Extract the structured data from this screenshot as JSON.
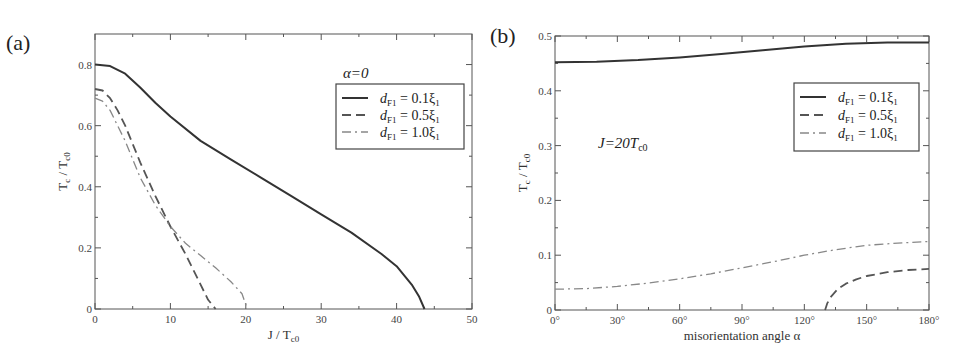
{
  "chart_data": [
    {
      "panel": "(a)",
      "type": "line",
      "title": "",
      "annotation": "α=0",
      "xlabel": "J / T",
      "xlabel_sub": "c0",
      "ylabel": "T",
      "ylabel_sub": "c",
      "ylabel_tail": " / T",
      "ylabel_sub2": "c0",
      "xlim": [
        0,
        50
      ],
      "ylim": [
        0,
        0.9
      ],
      "xticks": [
        0,
        10,
        20,
        30,
        40,
        50
      ],
      "xtick_labels": [
        "0",
        "10",
        "20",
        "30",
        "40",
        "50"
      ],
      "yticks": [
        0,
        0.2,
        0.4,
        0.6,
        0.8
      ],
      "ytick_labels": [
        "0",
        "0.2",
        "0.4",
        "0.6",
        "0.8"
      ],
      "grid": false,
      "legend_position": "upper right",
      "series": [
        {
          "name": "d_F1 = 0.1ξ1",
          "legend_text": "= 0.1ξ",
          "style": "solid",
          "x": [
            0,
            2,
            4,
            6,
            8,
            10,
            14,
            18,
            22,
            26,
            30,
            34,
            38,
            40,
            42,
            43,
            43.7
          ],
          "y": [
            0.8,
            0.795,
            0.77,
            0.725,
            0.675,
            0.63,
            0.55,
            0.49,
            0.43,
            0.37,
            0.31,
            0.25,
            0.18,
            0.14,
            0.08,
            0.04,
            0.0
          ]
        },
        {
          "name": "d_F1 = 0.5ξ1",
          "legend_text": "= 0.5ξ",
          "style": "dashed",
          "x": [
            0,
            1,
            2,
            3,
            4,
            5,
            6,
            8,
            10,
            12,
            14,
            15,
            16
          ],
          "y": [
            0.72,
            0.715,
            0.69,
            0.65,
            0.6,
            0.54,
            0.48,
            0.37,
            0.27,
            0.18,
            0.08,
            0.03,
            0.0
          ]
        },
        {
          "name": "d_F1 = 1.0ξ1",
          "legend_text": "= 1.0ξ",
          "style": "dashdot",
          "x": [
            0,
            1,
            2,
            3,
            4,
            5,
            6,
            8,
            10,
            12,
            14,
            16,
            18,
            19.5,
            20.2
          ],
          "y": [
            0.69,
            0.68,
            0.65,
            0.6,
            0.55,
            0.49,
            0.43,
            0.34,
            0.27,
            0.215,
            0.175,
            0.135,
            0.09,
            0.05,
            0.0
          ]
        }
      ]
    },
    {
      "panel": "(b)",
      "type": "line",
      "title": "",
      "annotation": "J=20T",
      "annotation_sub": "c0",
      "xlabel": "misorientation angle α",
      "ylabel": "T",
      "ylabel_sub": "c",
      "ylabel_tail": " / T",
      "ylabel_sub2": "c0",
      "xlim": [
        0,
        180
      ],
      "ylim": [
        0,
        0.5
      ],
      "xticks": [
        0,
        30,
        60,
        90,
        120,
        150,
        180
      ],
      "xtick_labels": [
        "0°",
        "30°",
        "60°",
        "90°",
        "120°",
        "150°",
        "180°"
      ],
      "yticks": [
        0,
        0.1,
        0.2,
        0.3,
        0.4,
        0.5
      ],
      "ytick_labels": [
        "0",
        "0.1",
        "0.2",
        "0.3",
        "0.4",
        "0.5"
      ],
      "grid": false,
      "legend_position": "upper right",
      "series": [
        {
          "name": "d_F1 = 0.1ξ1",
          "legend_text": "= 0.1ξ",
          "style": "solid",
          "x": [
            0,
            20,
            40,
            60,
            80,
            100,
            120,
            140,
            160,
            180
          ],
          "y": [
            0.452,
            0.453,
            0.456,
            0.461,
            0.467,
            0.474,
            0.481,
            0.486,
            0.488,
            0.488
          ]
        },
        {
          "name": "d_F1 = 0.5ξ1",
          "legend_text": "= 0.5ξ",
          "style": "dashed",
          "x": [
            130,
            131,
            133,
            136,
            140,
            145,
            150,
            160,
            170,
            180
          ],
          "y": [
            0.0,
            0.012,
            0.025,
            0.038,
            0.048,
            0.056,
            0.062,
            0.069,
            0.073,
            0.075
          ]
        },
        {
          "name": "d_F1 = 1.0ξ1",
          "legend_text": "= 1.0ξ",
          "style": "dashdot",
          "x": [
            0,
            15,
            30,
            45,
            60,
            75,
            90,
            105,
            120,
            135,
            150,
            165,
            180
          ],
          "y": [
            0.038,
            0.039,
            0.043,
            0.049,
            0.057,
            0.066,
            0.077,
            0.088,
            0.1,
            0.11,
            0.118,
            0.122,
            0.125
          ]
        }
      ]
    }
  ],
  "layout": {
    "panels": [
      {
        "x0": 95,
        "x1": 472,
        "y0": 309,
        "y1": 34
      },
      {
        "x0": 555,
        "x1": 929,
        "y0": 310,
        "y1": 36
      }
    ],
    "legend_boxes": [
      {
        "x": 336,
        "y": 84,
        "w": 128,
        "h": 65
      },
      {
        "x": 794,
        "y": 83,
        "w": 125,
        "h": 68
      }
    ],
    "annotation_pos": [
      {
        "x": 343,
        "y": 78
      },
      {
        "x": 598,
        "y": 148
      }
    ],
    "colors": {
      "solid": "#333333",
      "dashed": "#555555",
      "dashdot": "#888888"
    }
  }
}
